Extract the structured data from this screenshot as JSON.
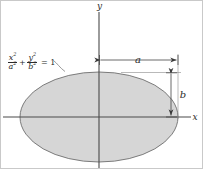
{
  "figure": {
    "background_color": "#ffffff",
    "border_color": "#c9c9c9"
  },
  "axes": {
    "x_label": "x",
    "y_label": "y",
    "origin": {
      "x": 98,
      "y": 116
    },
    "line_color": "#4a4a4a"
  },
  "ellipse": {
    "center_x": 98,
    "center_y": 116,
    "semi_major_a": 79,
    "semi_minor_b": 45,
    "fill_color": "#d6d6d6",
    "stroke_color": "#6e6e6e"
  },
  "equation": {
    "x_numerator": "x",
    "x_num_exp": "2",
    "x_denominator": "a",
    "x_den_exp": "2",
    "plus": "+",
    "y_numerator": "y",
    "y_num_exp": "2",
    "y_denominator": "b",
    "y_den_exp": "2",
    "equals": "= 1"
  },
  "dimensions": {
    "horizontal": {
      "label": "a",
      "from_x": 98,
      "to_x": 177,
      "y": 59
    },
    "vertical": {
      "label": "b",
      "x": 170,
      "from_y": 72,
      "to_y": 116
    }
  }
}
